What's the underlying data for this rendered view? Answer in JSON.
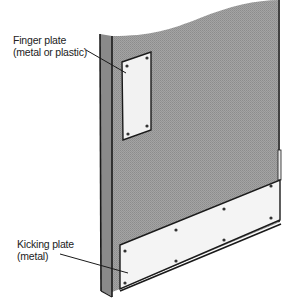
{
  "diagram": {
    "labels": {
      "finger_plate": {
        "line1": "Finger plate",
        "line2": "(metal or plastic)"
      },
      "kicking_plate": {
        "line1": "Kicking plate",
        "line2": "(metal)"
      }
    },
    "colors": {
      "door_fill": "#9a9a9a",
      "edge_fill": "#8a8a8a",
      "plate_fill": "#f4f4f4",
      "outline": "#1a1a1a",
      "background": "#ffffff"
    }
  }
}
